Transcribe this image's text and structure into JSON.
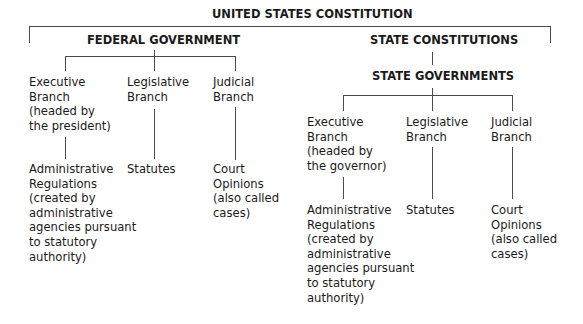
{
  "root": {
    "title": "UNITED STATES CONSTITUTION"
  },
  "federal": {
    "title": "FEDERAL GOVERNMENT",
    "branches": [
      {
        "label": "Executive\nBranch\n(headed by\nthe president)",
        "source": "Administrative\nRegulations\n(created by\nadministrative\nagencies pursuant\nto statutory\nauthority)"
      },
      {
        "label": "Legislative\nBranch",
        "source": "Statutes"
      },
      {
        "label": "Judicial\nBranch",
        "source": "Court\nOpinions\n(also called\ncases)"
      }
    ]
  },
  "state": {
    "constitutions_title": "STATE CONSTITUTIONS",
    "title": "STATE GOVERNMENTS",
    "branches": [
      {
        "label": "Executive\nBranch\n(headed by\nthe governor)",
        "source": "Administrative\nRegulations\n(created by\nadministrative\nagencies pursuant\nto statutory\nauthority)"
      },
      {
        "label": "Legislative\nBranch",
        "source": "Statutes"
      },
      {
        "label": "Judicial\nBranch",
        "source": "Court\nOpinions\n(also called\ncases)"
      }
    ]
  },
  "colors": {
    "line": "#4a4a4a",
    "text": "#1a1a1a",
    "background": "#ffffff"
  }
}
